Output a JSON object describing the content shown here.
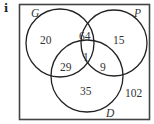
{
  "part_label": "i",
  "diagram": {
    "type": "venn-3",
    "sets": [
      {
        "name": "G"
      },
      {
        "name": "P"
      },
      {
        "name": "D"
      }
    ],
    "regions": {
      "G_only": "20",
      "P_only": "15",
      "D_only": "35",
      "G_P_only": "64",
      "G_D_only": "29",
      "P_D_only": "9",
      "G_P_D": "1",
      "outside": "102"
    },
    "colors": {
      "stroke": "#222222",
      "frame": "#444444",
      "text": "#333333"
    }
  }
}
